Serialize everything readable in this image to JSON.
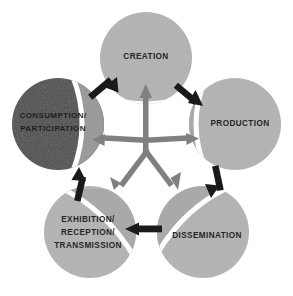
{
  "diagram": {
    "type": "cyclical-process",
    "background_color": "#ffffff",
    "hub": {
      "cx": 146,
      "cy": 152
    },
    "colors": {
      "light_circle": "#b3b3b3",
      "light_circle_segment": "#a8a8a8",
      "dark_circle": "#4d4d4d",
      "dark_circle_segment": "#9a9a9a",
      "spoke_arrow": "#808080",
      "cycle_arrow": "#1a1a1a",
      "label_dark_on_light": "#262626",
      "label_light_on_dark": "#1f1f1f",
      "separator": "#ffffff"
    },
    "nodes": [
      {
        "id": "creation",
        "label_lines": [
          "CREATION"
        ],
        "cx": 146,
        "cy": 58,
        "r": 46,
        "tone": "light",
        "label_x": 146,
        "label_y": 59,
        "font_size": 8.2,
        "segment_rotation": 90
      },
      {
        "id": "production",
        "label_lines": [
          "PRODUCTION"
        ],
        "cx": 235,
        "cy": 124,
        "r": 46,
        "tone": "light",
        "label_x": 240,
        "label_y": 126,
        "font_size": 8.2,
        "segment_rotation": 196
      },
      {
        "id": "dissemination",
        "label_lines": [
          "DISSEMINATION"
        ],
        "cx": 203,
        "cy": 232,
        "r": 46,
        "tone": "light",
        "label_x": 207,
        "label_y": 238,
        "font_size": 8.2,
        "segment_rotation": 260
      },
      {
        "id": "exhibition-reception-transmission",
        "label_lines": [
          "EXHIBITION/",
          "RECEPTION/",
          "TRANSMISSION"
        ],
        "cx": 90,
        "cy": 232,
        "r": 46,
        "tone": "light",
        "label_x": 88,
        "label_y": 222,
        "font_size": 8.2,
        "segment_rotation": 315
      },
      {
        "id": "consumption-participation",
        "label_lines": [
          "CONSUMPTION/",
          "PARTICIPATION"
        ],
        "cx": 58,
        "cy": 124,
        "r": 46,
        "tone": "dark",
        "label_x": 53,
        "label_y": 118,
        "font_size": 8.0,
        "segment_rotation": 20
      }
    ],
    "spokes": [
      {
        "id": "hub-to-creation",
        "from": "hub",
        "to": "creation",
        "angle_deg": -90,
        "color": "#808080"
      },
      {
        "id": "hub-to-production",
        "from": "hub",
        "to": "production",
        "angle_deg": -18,
        "color": "#808080"
      },
      {
        "id": "hub-to-dissemination",
        "from": "hub",
        "to": "dissemination",
        "angle_deg": 54,
        "color": "#808080"
      },
      {
        "id": "hub-to-exhibition",
        "from": "hub",
        "to": "exhibition-reception-transmission",
        "angle_deg": 126,
        "color": "#808080"
      },
      {
        "id": "hub-to-consumption",
        "from": "hub",
        "to": "consumption-participation",
        "angle_deg": 198,
        "color": "#808080"
      }
    ],
    "cycle_arrows": [
      {
        "id": "creation-to-production",
        "from": "creation",
        "to": "production",
        "direction": "down-right",
        "color": "#1a1a1a"
      },
      {
        "id": "production-to-dissemination",
        "from": "production",
        "to": "dissemination",
        "direction": "down",
        "color": "#1a1a1a"
      },
      {
        "id": "dissemination-to-exhibition",
        "from": "dissemination",
        "to": "exhibition-reception-transmission",
        "direction": "left",
        "color": "#1a1a1a"
      },
      {
        "id": "exhibition-to-consumption",
        "from": "exhibition-reception-transmission",
        "to": "consumption-participation",
        "direction": "up",
        "color": "#1a1a1a"
      },
      {
        "id": "consumption-to-creation",
        "from": "consumption-participation",
        "to": "creation",
        "direction": "up-right",
        "color": "#1a1a1a"
      }
    ]
  }
}
